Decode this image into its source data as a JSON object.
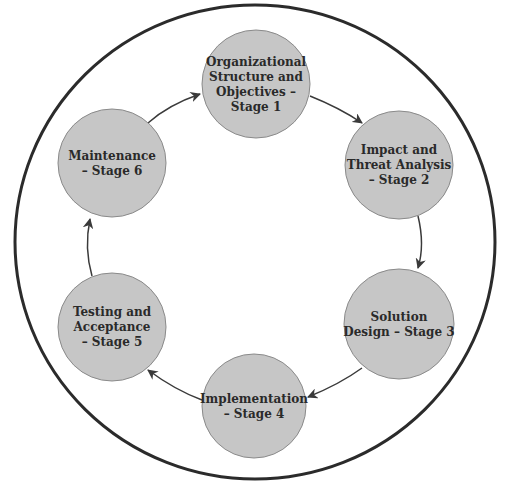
{
  "diagram": {
    "type": "cycle",
    "outer_ring": {
      "cx": 255,
      "cy": 242,
      "rx": 240,
      "ry": 237,
      "stroke": "#2b2b2b"
    },
    "node_style": {
      "fill": "#c6c6c6",
      "stroke": "#8a8a8a",
      "text_color": "#2a2a2a"
    },
    "arrow_color": "#3a3a3a",
    "nodes": [
      {
        "id": "stage1",
        "cx": 256,
        "cy": 84,
        "r": 54,
        "lines": [
          "Organizational",
          "Structure and",
          "Objectives –",
          "Stage 1"
        ]
      },
      {
        "id": "stage2",
        "cx": 399,
        "cy": 165,
        "r": 54,
        "lines": [
          "Impact and",
          "Threat Analysis",
          "– Stage 2"
        ]
      },
      {
        "id": "stage3",
        "cx": 399,
        "cy": 324,
        "r": 55,
        "lines": [
          "Solution",
          "Design – Stage 3"
        ]
      },
      {
        "id": "stage4",
        "cx": 254,
        "cy": 406,
        "r": 52,
        "lines": [
          "Implementation",
          "– Stage 4"
        ]
      },
      {
        "id": "stage5",
        "cx": 112,
        "cy": 327,
        "r": 54,
        "lines": [
          "Testing and",
          "Acceptance",
          "– Stage 5"
        ]
      },
      {
        "id": "stage6",
        "cx": 112,
        "cy": 163,
        "r": 54,
        "lines": [
          "Maintenance",
          "– Stage 6"
        ]
      }
    ],
    "edges": [
      {
        "from": "stage1",
        "to": "stage2",
        "path": "M310,96 Q340,108 362,123"
      },
      {
        "from": "stage2",
        "to": "stage3",
        "path": "M418,216 Q425,245 418,268"
      },
      {
        "from": "stage3",
        "to": "stage4",
        "path": "M362,368 Q340,384 308,397"
      },
      {
        "from": "stage4",
        "to": "stage5",
        "path": "M202,400 Q175,390 148,370"
      },
      {
        "from": "stage5",
        "to": "stage6",
        "path": "M92,276 Q84,248 90,219"
      },
      {
        "from": "stage6",
        "to": "stage1",
        "path": "M148,123 Q168,105 200,94"
      }
    ]
  }
}
